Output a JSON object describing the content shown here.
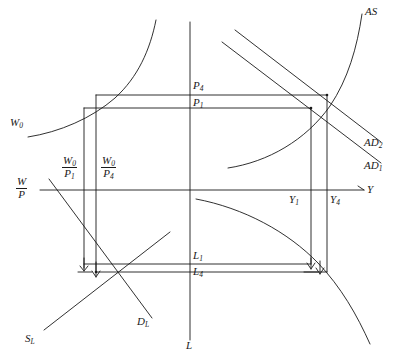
{
  "figure": {
    "type": "economics-four-quadrant-diagram",
    "stroke_color": "#1a1a1a",
    "background_color": "#ffffff"
  },
  "axes": {
    "vertical_price_axis": {
      "name": "vertical-axis"
    },
    "horizontal_realwage_axis": {
      "name": "horizontal-axis"
    },
    "output_axis_label": "Y",
    "labor_axis_label": "L",
    "real_wage_axis_label_numerator": "W",
    "real_wage_axis_label_denominator": "P"
  },
  "curves": [
    {
      "id": "as",
      "label": "AS",
      "quadrant": "upper-right"
    },
    {
      "id": "ad2",
      "label": "AD",
      "sub": "2",
      "quadrant": "upper-right"
    },
    {
      "id": "ad1",
      "label": "AD",
      "sub": "1",
      "quadrant": "upper-right"
    },
    {
      "id": "w0",
      "label": "W",
      "sub": "0",
      "quadrant": "upper-left"
    },
    {
      "id": "sl",
      "label": "S",
      "sub": "L",
      "quadrant": "lower-left"
    },
    {
      "id": "dl",
      "label": "D",
      "sub": "L",
      "quadrant": "lower-left"
    },
    {
      "id": "production-function",
      "label": "",
      "quadrant": "lower-right"
    }
  ],
  "price_levels": [
    {
      "id": "p4",
      "base": "P",
      "sub": "4"
    },
    {
      "id": "p1",
      "base": "P",
      "sub": "1"
    }
  ],
  "real_wages": [
    {
      "id": "w0-over-p1",
      "numerator": "W",
      "num_sub": "0",
      "denominator": "P",
      "den_sub": "1"
    },
    {
      "id": "w0-over-p4",
      "numerator": "W",
      "num_sub": "0",
      "denominator": "P",
      "den_sub": "4"
    }
  ],
  "output_levels": [
    {
      "id": "y1",
      "base": "Y",
      "sub": "1"
    },
    {
      "id": "y4",
      "base": "Y",
      "sub": "4"
    }
  ],
  "labor_levels": [
    {
      "id": "l1",
      "base": "L",
      "sub": "1"
    },
    {
      "id": "l4",
      "base": "L",
      "sub": "4"
    }
  ],
  "arrows": [
    {
      "id": "labor-adjust-arrow-1",
      "direction": "down",
      "quadrant": "lower-left"
    },
    {
      "id": "labor-adjust-arrow-2",
      "direction": "down",
      "quadrant": "lower-left"
    },
    {
      "id": "output-adjust-arrow-1",
      "direction": "down",
      "quadrant": "lower-right"
    },
    {
      "id": "output-adjust-arrow-2",
      "direction": "down",
      "quadrant": "lower-right"
    }
  ]
}
